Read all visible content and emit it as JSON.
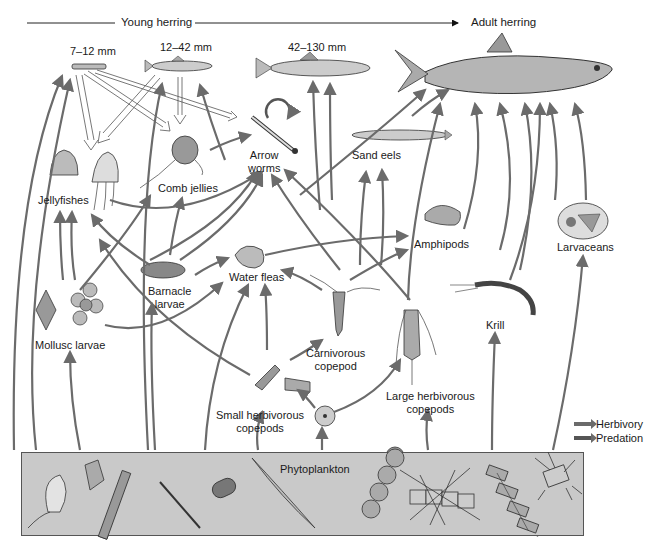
{
  "header": {
    "young_herring": "Young herring",
    "adult_herring": "Adult herring"
  },
  "stages": {
    "stage1": "7–12 mm",
    "stage2": "12–42 mm",
    "stage3": "42–130 mm"
  },
  "organisms": {
    "arrow_worms": "Arrow\nworms",
    "sand_eels": "Sand eels",
    "jellyfishes": "Jellyfishes",
    "comb_jellies": "Comb jellies",
    "amphipods": "Amphipods",
    "larvaceans": "Larvaceans",
    "barnacle_larvae": "Barnacle\nlarvae",
    "water_fleas": "Water fleas",
    "mollusc_larvae": "Mollusc larvae",
    "krill": "Krill",
    "carnivorous_copepod": "Carnivorous\ncopepod",
    "large_herbivorous_copepods": "Large herbivorous\ncopepods",
    "small_herbivorous_copepods": "Small herbivorous\ncopepods",
    "phytoplankton": "Phytoplankton"
  },
  "legend": {
    "herbivory": "Herbivory",
    "predation": "Predation"
  },
  "colors": {
    "arrow": "#6b6b6b",
    "phytoplankton_box": "#c9c9c9",
    "hollow_arrow_stroke": "#555555",
    "background": "#ffffff"
  }
}
